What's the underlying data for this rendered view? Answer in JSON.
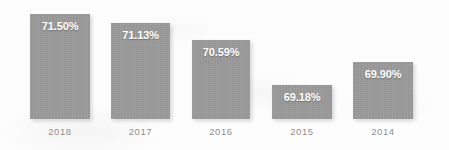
{
  "chart_data": {
    "type": "bar",
    "title": "",
    "subtitle": "",
    "xlabel": "",
    "ylabel": "",
    "categories": [
      "2018",
      "2017",
      "2016",
      "2015",
      "2014"
    ],
    "values": [
      71.5,
      71.13,
      70.59,
      69.18,
      69.9
    ],
    "value_labels": [
      "71.50%",
      "71.13%",
      "70.59%",
      "69.18%",
      "69.90%"
    ],
    "ylim": [
      68.7,
      71.8
    ],
    "grid": false,
    "legend": null,
    "legend_position": "none",
    "annotations": [],
    "series": [
      {
        "name": "",
        "values": [
          71.5,
          71.13,
          70.59,
          69.18,
          69.9
        ]
      }
    ]
  },
  "style": {
    "bar_color": "#9a9a9a",
    "value_label_color": "#ffffff",
    "category_label_color": "#8e8e8e",
    "background_color": "#fdfdfd"
  },
  "layout": {
    "bars": [
      {
        "left": 30,
        "width": 60,
        "top": 14,
        "height": 105,
        "label_top": 20
      },
      {
        "left": 111,
        "width": 59,
        "top": 23,
        "height": 96,
        "label_top": 29
      },
      {
        "left": 192,
        "width": 58,
        "top": 40,
        "height": 79,
        "label_top": 46
      },
      {
        "left": 272,
        "width": 60,
        "top": 85,
        "height": 34,
        "label_top": 91
      },
      {
        "left": 353,
        "width": 60,
        "top": 62,
        "height": 57,
        "label_top": 68
      }
    ],
    "baseline_y": 119,
    "category_label_y": 126
  }
}
